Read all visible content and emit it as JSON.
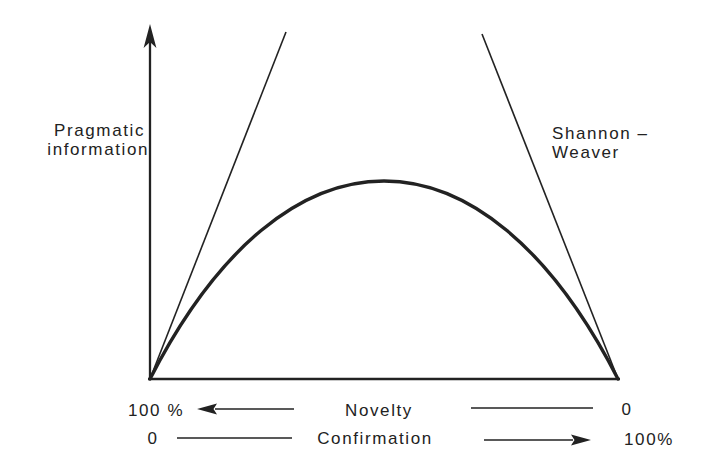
{
  "figure": {
    "colors": {
      "ink": "#222222",
      "background": "#ffffff"
    },
    "y_axis_label": {
      "line1": "Pragmatic",
      "line2": "information"
    },
    "annotation": {
      "line1": "Shannon –",
      "line2": "Weaver"
    },
    "novelty_row": {
      "left": "100 %",
      "label": "Novelty",
      "right": "0"
    },
    "confirmation_row": {
      "left": "0",
      "label": "Confirmation",
      "right": "100%"
    }
  },
  "chart_data": {
    "type": "line",
    "title": "",
    "ylabel": "Pragmatic information",
    "xlabel": "",
    "grid": false,
    "xlim": [
      0,
      1
    ],
    "ylim": [
      0,
      1
    ],
    "x_axis_note": "x runs from 100% novelty / 0 confirmation (left) to 0 novelty / 100% confirmation (right)",
    "x_axes": [
      {
        "label": "Novelty",
        "left_end": "100 %",
        "right_end": "0",
        "arrow_points": "left"
      },
      {
        "label": "Confirmation",
        "left_end": "0",
        "right_end": "100%",
        "arrow_points": "right"
      }
    ],
    "series": [
      {
        "name": "Pragmatic information",
        "style": "thick curve, zero at both extremes, maximum in the middle",
        "x": [
          0,
          0.09,
          0.21,
          0.35,
          0.5,
          0.65,
          0.79,
          0.91,
          1
        ],
        "y": [
          0,
          0.24,
          0.42,
          0.52,
          0.56,
          0.52,
          0.42,
          0.24,
          0
        ]
      },
      {
        "name": "Shannon-Weaver (left branch)",
        "style": "thin straight line rising from left origin",
        "x": [
          0,
          0.29
        ],
        "y": [
          0,
          0.98
        ]
      },
      {
        "name": "Shannon-Weaver (right branch)",
        "style": "thin straight line rising from right origin",
        "x": [
          1,
          0.71
        ],
        "y": [
          0,
          0.98
        ]
      }
    ],
    "annotations": [
      {
        "text": "Shannon – Weaver",
        "position": "right side, beside right branch"
      }
    ],
    "legend": "none"
  },
  "geometry": {
    "y_axis_line": {
      "x1": 150,
      "y1": 380,
      "x2": 150,
      "y2": 42
    },
    "y_axis_arrowhead": {
      "points": "150,24 143.6,48 150,42 156.4,48"
    },
    "baseline": {
      "x1": 148,
      "y1": 379,
      "x2": 620,
      "y2": 379
    },
    "left_line": {
      "x1": 150,
      "y1": 379,
      "x2": 286,
      "y2": 32
    },
    "right_line": {
      "x1": 482,
      "y1": 34,
      "x2": 618,
      "y2": 379
    },
    "curve": {
      "d": "M 150 379 C 285 115, 483 115, 618 379"
    },
    "novelty_arrow_line": {
      "x1": 215,
      "y1": 409,
      "x2": 294,
      "y2": 409
    },
    "novelty_arrowhead": {
      "points": "197,409 217,403.4 213.5,409 217,414.6"
    },
    "novelty_right_line": {
      "x1": 471,
      "y1": 408,
      "x2": 593,
      "y2": 408
    },
    "confirm_left_line": {
      "x1": 177,
      "y1": 438,
      "x2": 292,
      "y2": 438
    },
    "confirm_arrow_line": {
      "x1": 484,
      "y1": 440,
      "x2": 573,
      "y2": 440
    },
    "confirm_arrowhead": {
      "points": "591,440 571,434.4 574.5,440 571,445.6"
    }
  }
}
